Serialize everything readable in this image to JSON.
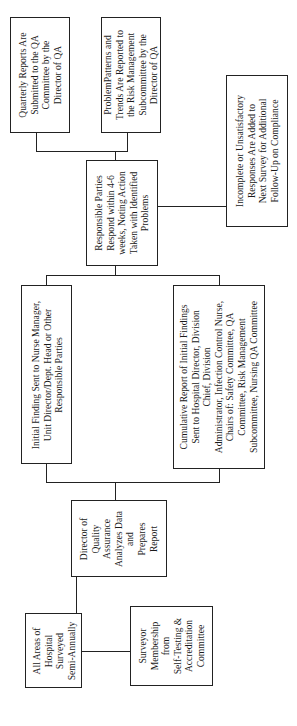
{
  "diagram": {
    "type": "flowchart",
    "orientation": "rotated-90-ccw",
    "nodes": {
      "all_areas": {
        "lines": [
          "All Areas of",
          "Hospital",
          "Surveyed",
          "Semi-Annually"
        ]
      },
      "surveyor": {
        "lines": [
          "Surveyor",
          "Membership",
          "from",
          "Self-Testing &",
          "Accreditation",
          "Committee"
        ]
      },
      "director_qa": {
        "lines": [
          "Director of",
          "Quality",
          "Assurance",
          "Analyzes Data",
          "and",
          "Prepares",
          "Report"
        ]
      },
      "initial_finding": {
        "lines": [
          "Initial Finding Sent to Nurse Manager,",
          "Unit Director/Dept. Head or Other",
          "Responsible Parties"
        ]
      },
      "cumulative_report": {
        "lines": [
          "Cumulative Report of Initial Findings",
          "Sent to Hospital Director, Division",
          "Chief, Division",
          "Administrator, Infection Control Nurse,",
          "Chairs of: Safety Committee, QA",
          "Committee, Risk Management",
          "Subcommittee, Nursing QA Committee"
        ]
      },
      "responsible_parties": {
        "lines": [
          "Responsible Parties",
          "Respond within 4-6",
          "weeks, Noting Action",
          "Taken with Identified",
          "Problems"
        ]
      },
      "quarterly_reports": {
        "lines": [
          "Quarterly Reports Are",
          "Submitted to the QA",
          "Committee by the",
          "Director of QA"
        ]
      },
      "problem_patterns": {
        "lines": [
          "ProblemPatterns and",
          "Trends Are Reported to",
          "the Risk Management",
          "Subcommittee by the",
          "Director of QA"
        ]
      },
      "incomplete_responses": {
        "lines": [
          "Incomplete or Unsatisfactory",
          "Responses Are Added to",
          "Next Survey for Additional",
          "Follow-Up on Compliance"
        ]
      }
    },
    "edges": [
      [
        "all_areas",
        "surveyor"
      ],
      [
        "all_areas",
        "director_qa"
      ],
      [
        "director_qa",
        "initial_finding"
      ],
      [
        "director_qa",
        "cumulative_report"
      ],
      [
        "initial_finding",
        "responsible_parties"
      ],
      [
        "cumulative_report",
        "responsible_parties"
      ],
      [
        "responsible_parties",
        "quarterly_reports"
      ],
      [
        "responsible_parties",
        "problem_patterns"
      ],
      [
        "responsible_parties",
        "incomplete_responses"
      ]
    ]
  }
}
